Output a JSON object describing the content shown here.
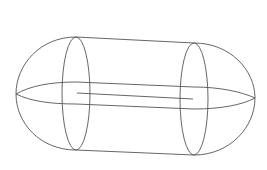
{
  "diagram": {
    "type": "wireframe-capsule",
    "stroke_color": "#555555",
    "background": "#ffffff",
    "stroke_width": 0.9,
    "shapes": {
      "left_cap": "M76,37 C40,37 16,65 16,94 C16,123 40,150 76,150",
      "right_cap": "M194,43 C230,43 255,70 255,98 C255,127 230,155 194,155",
      "top_edge": "M76,37 L194,43",
      "bottom_edge": "M76,150 L194,155",
      "left_ring": {
        "cx": 76,
        "cy": 93.5,
        "rx": 14,
        "ry": 56.5
      },
      "right_ring": {
        "cx": 194,
        "cy": 99,
        "rx": 14,
        "ry": 56
      },
      "equator_top": "M16,94 C30,86 50,82 76,82 L194,87 C220,87 242,92 255,98",
      "equator_bottom": "M16,94 C30,101 50,104 76,104 L194,109 C220,109 242,105 255,98",
      "axis_line": "M77,93 L193,99"
    }
  }
}
